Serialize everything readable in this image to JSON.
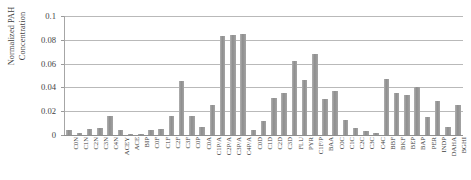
{
  "chart_data": {
    "type": "bar",
    "title": "",
    "xlabel": "",
    "ylabel": "Normalized PAH Concentration",
    "ylabel_lines": [
      "Normalized PAH",
      "Concentration"
    ],
    "ylim": [
      0,
      0.1
    ],
    "yticks": [
      0,
      0.02,
      0.04,
      0.06,
      0.08,
      0.1
    ],
    "ytick_labels": [
      "0",
      "0.02",
      "0.04",
      "0.06",
      "0.08",
      "0.1"
    ],
    "grid": true,
    "grid_axis": "y",
    "legend": false,
    "bar_color": "#9b9b9b",
    "categories": [
      "C0N",
      "C1N",
      "C2N",
      "C3N",
      "C4N",
      "ACEY",
      "ACE",
      "BIP",
      "C0F",
      "C1F",
      "C2F",
      "C3F",
      "C0P",
      "C0A",
      "C1P/A",
      "C2P/A",
      "C3P/A",
      "C4P/A",
      "C0D",
      "C1D",
      "C2D",
      "C3D",
      "FLU",
      "PYR",
      "C1F/P",
      "BAA",
      "C0C",
      "C1C",
      "C2C",
      "C3C",
      "C4C",
      "BBF",
      "BKF",
      "BEP",
      "BAP",
      "PER",
      "INDP",
      "DAHA",
      "BGHI"
    ],
    "values": [
      0.004,
      0.002,
      0.005,
      0.006,
      0.016,
      0.004,
      0.001,
      0.0005,
      0.004,
      0.005,
      0.016,
      0.045,
      0.016,
      0.007,
      0.025,
      0.083,
      0.084,
      0.085,
      0.004,
      0.012,
      0.031,
      0.035,
      0.062,
      0.046,
      0.068,
      0.03,
      0.037,
      0.013,
      0.006,
      0.003,
      0.002,
      0.047,
      0.035,
      0.034,
      0.04,
      0.015,
      0.029,
      0.007,
      0.025
    ]
  }
}
